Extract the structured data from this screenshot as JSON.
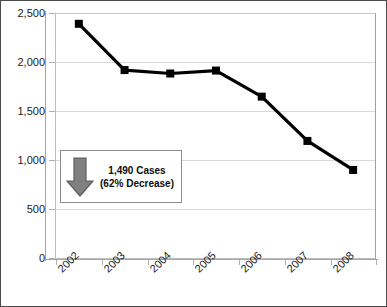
{
  "chart_data": {
    "type": "line",
    "title": "",
    "subtitle": "",
    "xlabel": "",
    "ylabel": "",
    "categories": [
      "2002",
      "2003",
      "2004",
      "2005",
      "2006",
      "2007",
      "2008"
    ],
    "series": [
      {
        "name": "Cases",
        "values": [
          2390,
          1920,
          1885,
          1915,
          1650,
          1200,
          905
        ],
        "color": "#000000",
        "marker": "square"
      }
    ],
    "ylim": [
      0,
      2500
    ],
    "y_ticks": [
      0,
      500,
      1000,
      1500,
      2000,
      2500
    ],
    "y_tick_labels": [
      "0",
      "500",
      "1,000",
      "1,500",
      "2,000",
      "2,500"
    ],
    "x_tick_labels": [
      "2002",
      "2003",
      "2004",
      "2005",
      "2006",
      "2007",
      "2008"
    ],
    "x_tick_label_rotation": -45,
    "grid": {
      "horizontal": true,
      "vertical": false,
      "color": "#d9d9d9"
    },
    "legend": {
      "visible": false,
      "position": "none"
    },
    "annotations": [
      {
        "name": "decrease-callout",
        "icon": "down-arrow-icon",
        "line1": "1,490 Cases",
        "line2": "(62% Decrease)",
        "arrow_fill": "#808080",
        "arrow_stroke": "#5a5a5a",
        "box_border": "#8c8c8c",
        "box_fill": "#ffffff"
      }
    ],
    "colors": {
      "series": "#000000",
      "gridline": "#d9d9d9",
      "axis": "#a6a6a6",
      "plot_border": "#bdbdbd",
      "frame_border": "#4a4a4a",
      "text": "#1a1a1a"
    }
  }
}
